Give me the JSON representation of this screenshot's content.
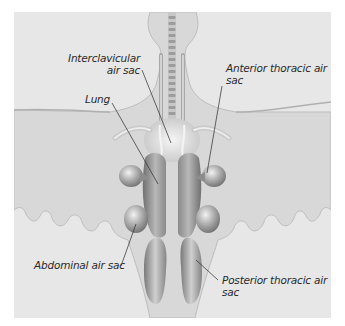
{
  "figure": {
    "colors": {
      "page_background": "#ffffff",
      "panel_background": "#e7e7e7",
      "body_fill": "#d8d8d8",
      "body_edge": "#bdbdbd",
      "organ_dark": "#7d7d7d",
      "organ_light": "#e2e2e2",
      "label_text": "#2a2a2a",
      "leader_line": "#2a2a2a"
    },
    "labels": {
      "interclavicular": {
        "line1": "Interclavicular",
        "line2": "air sac"
      },
      "lung": {
        "line1": "Lung"
      },
      "anterior_thoracic": {
        "line1": "Anterior thoracic air",
        "line2": "sac"
      },
      "abdominal": {
        "line1": "Abdominal air sac"
      },
      "posterior_thoracic": {
        "line1": "Posterior thoracic air",
        "line2": "sac"
      }
    }
  }
}
